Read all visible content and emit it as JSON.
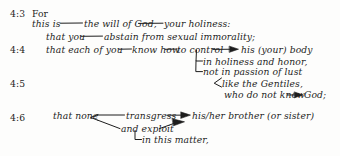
{
  "document": {
    "kind": "sentence-flow-diagram",
    "passage_reference": "4:3-4:6",
    "ink_color": "#1d1d1d",
    "paper_color": "#fdfdfc"
  },
  "verse_labels": [
    {
      "id": "v43",
      "text": "4:3"
    },
    {
      "id": "v44",
      "text": "4:4"
    },
    {
      "id": "v45",
      "text": "4:5"
    },
    {
      "id": "v46",
      "text": "4:6"
    }
  ],
  "lines": [
    {
      "id": "l1",
      "text": "For"
    },
    {
      "id": "l2a",
      "text": "this is"
    },
    {
      "id": "l2b",
      "text": "the will of God,"
    },
    {
      "id": "l2c",
      "text": "your holiness:"
    },
    {
      "id": "l3a",
      "text": "that you"
    },
    {
      "id": "l3b",
      "text": "abstain from sexual immorality;"
    },
    {
      "id": "l4a",
      "text": "that each of you"
    },
    {
      "id": "l4b",
      "text": "know how"
    },
    {
      "id": "l4c",
      "text": "to control"
    },
    {
      "id": "l4d",
      "text": "his (your) body"
    },
    {
      "id": "l5",
      "text": "in holiness and honor,"
    },
    {
      "id": "l6",
      "text": "not in passion of lust"
    },
    {
      "id": "l7",
      "text": "like the Gentiles,"
    },
    {
      "id": "l8a",
      "text": "who do not know"
    },
    {
      "id": "l8b",
      "text": "God;"
    },
    {
      "id": "l9a",
      "text": "that none"
    },
    {
      "id": "l9b",
      "text": "transgress"
    },
    {
      "id": "l9c",
      "text": "his/her brother (or sister)"
    },
    {
      "id": "l10",
      "text": "and exploit"
    },
    {
      "id": "l11",
      "text": "in this matter,"
    }
  ]
}
